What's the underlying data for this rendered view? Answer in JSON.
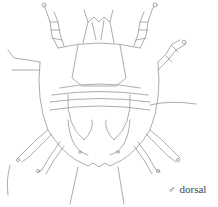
{
  "figure": {
    "stroke_color": "#8a8a8a"
  },
  "caption": {
    "symbol": "♂",
    "label": "dorsal"
  }
}
